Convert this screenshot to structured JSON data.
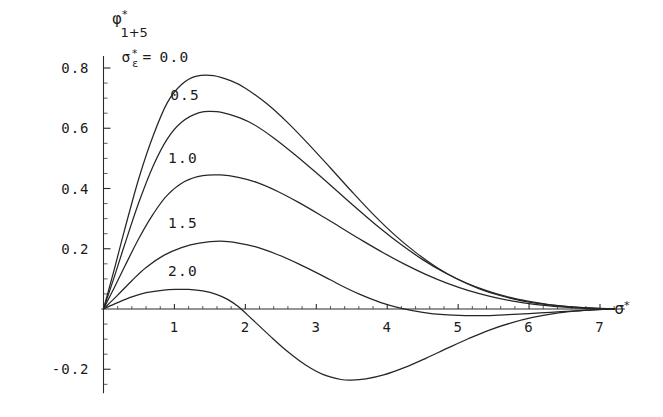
{
  "chart_data": {
    "type": "line",
    "title": "",
    "subtitle": "",
    "xlabel": "σ*",
    "ylabel": "φ*1+5",
    "ylabel_parts": {
      "base": "φ",
      "sup": "*",
      "sub": "1+5"
    },
    "xlabel_parts": {
      "base": "σ",
      "sup": "*"
    },
    "legend_title_parts": {
      "base": "σ",
      "sup": "*",
      "sub": "ε"
    },
    "legend_title": "σ*ε =",
    "legend_position": "inline-on-curves",
    "grid": false,
    "xlim": [
      0,
      7.35
    ],
    "ylim": [
      -0.28,
      0.84
    ],
    "x_ticks": [
      1,
      2,
      3,
      4,
      5,
      6,
      7
    ],
    "x_tick_labels": [
      "1",
      "2",
      "3",
      "4",
      "5",
      "6",
      "7"
    ],
    "x_minor_step": 0.2,
    "y_ticks": [
      0.8,
      0.6,
      0.4,
      0.2,
      -0.2
    ],
    "y_tick_labels": [
      "0.8",
      "0.6",
      "0.4",
      "0.2",
      "-0.2"
    ],
    "y_minor_step": 0.05,
    "series": [
      {
        "name": "0.0",
        "label": "0.0",
        "label_text": "σ*ε = 0.0",
        "peak_x": 1.55,
        "peak_y": 0.775,
        "x": [
          0,
          0.15,
          0.3,
          0.5,
          0.7,
          0.9,
          1.1,
          1.3,
          1.55,
          1.8,
          2.0,
          2.3,
          2.6,
          2.9,
          3.2,
          3.5,
          3.8,
          4.1,
          4.4,
          4.7,
          5.0,
          5.3,
          5.6,
          5.9,
          6.2,
          6.5,
          6.8,
          7.0,
          7.2
        ],
        "values": [
          0,
          0.13,
          0.265,
          0.435,
          0.575,
          0.685,
          0.745,
          0.772,
          0.775,
          0.757,
          0.733,
          0.682,
          0.618,
          0.545,
          0.468,
          0.39,
          0.315,
          0.247,
          0.188,
          0.138,
          0.098,
          0.067,
          0.044,
          0.027,
          0.016,
          0.009,
          0.004,
          0.002,
          0.001
        ]
      },
      {
        "name": "0.5",
        "label": "0.5",
        "peak_x": 1.6,
        "peak_y": 0.655,
        "x": [
          0,
          0.15,
          0.3,
          0.5,
          0.7,
          0.9,
          1.1,
          1.35,
          1.6,
          1.85,
          2.1,
          2.4,
          2.7,
          3.0,
          3.3,
          3.6,
          3.9,
          4.2,
          4.5,
          4.8,
          5.1,
          5.4,
          5.7,
          6.0,
          6.3,
          6.6,
          6.9,
          7.1,
          7.2
        ],
        "values": [
          0,
          0.105,
          0.215,
          0.355,
          0.475,
          0.565,
          0.62,
          0.652,
          0.655,
          0.64,
          0.615,
          0.568,
          0.512,
          0.452,
          0.39,
          0.328,
          0.268,
          0.213,
          0.164,
          0.122,
          0.088,
          0.061,
          0.04,
          0.025,
          0.014,
          0.007,
          0.003,
          0.001,
          0.001
        ]
      },
      {
        "name": "1.0",
        "label": "1.0",
        "peak_x": 1.65,
        "peak_y": 0.445,
        "x": [
          0,
          0.15,
          0.3,
          0.5,
          0.7,
          0.9,
          1.15,
          1.4,
          1.65,
          1.9,
          2.15,
          2.45,
          2.75,
          3.05,
          3.35,
          3.65,
          3.95,
          4.25,
          4.55,
          4.85,
          5.15,
          5.45,
          5.75,
          6.05,
          6.35,
          6.65,
          6.95,
          7.15,
          7.2
        ],
        "values": [
          0,
          0.07,
          0.142,
          0.235,
          0.315,
          0.378,
          0.424,
          0.443,
          0.445,
          0.437,
          0.421,
          0.391,
          0.354,
          0.313,
          0.27,
          0.227,
          0.186,
          0.148,
          0.114,
          0.085,
          0.061,
          0.042,
          0.027,
          0.016,
          0.009,
          0.004,
          0.001,
          0,
          0
        ]
      },
      {
        "name": "1.5",
        "label": "1.5",
        "peak_x": 1.65,
        "peak_y": 0.225,
        "zero_crossing": 3.35,
        "dip_min_y": -0.022,
        "x": [
          0,
          0.2,
          0.4,
          0.6,
          0.85,
          1.1,
          1.35,
          1.65,
          1.9,
          2.15,
          2.45,
          2.75,
          3.05,
          3.35,
          3.6,
          3.9,
          4.2,
          4.5,
          4.8,
          5.1,
          5.4,
          5.7,
          6.0,
          6.3,
          6.6,
          6.9,
          7.1,
          7.2
        ],
        "values": [
          0,
          0.046,
          0.094,
          0.138,
          0.178,
          0.204,
          0.219,
          0.225,
          0.219,
          0.206,
          0.181,
          0.15,
          0.115,
          0.078,
          0.05,
          0.022,
          0.002,
          -0.011,
          -0.019,
          -0.022,
          -0.022,
          -0.019,
          -0.015,
          -0.011,
          -0.007,
          -0.003,
          -0.001,
          0
        ]
      },
      {
        "name": "2.0",
        "label": "2.0",
        "peak_x": 1.2,
        "peak_y": 0.065,
        "zero_crossing": 1.9,
        "dip_min_x": 3.5,
        "dip_min_y": -0.235,
        "x": [
          0,
          0.2,
          0.4,
          0.6,
          0.85,
          1.05,
          1.2,
          1.4,
          1.6,
          1.75,
          1.9,
          2.1,
          2.35,
          2.6,
          2.85,
          3.1,
          3.35,
          3.5,
          3.7,
          3.95,
          4.25,
          4.55,
          4.85,
          5.15,
          5.45,
          5.75,
          6.05,
          6.35,
          6.65,
          6.95,
          7.15,
          7.2
        ],
        "values": [
          0,
          0.021,
          0.04,
          0.054,
          0.063,
          0.065,
          0.065,
          0.06,
          0.048,
          0.032,
          0.008,
          -0.035,
          -0.09,
          -0.142,
          -0.186,
          -0.218,
          -0.234,
          -0.236,
          -0.232,
          -0.219,
          -0.194,
          -0.163,
          -0.13,
          -0.098,
          -0.069,
          -0.046,
          -0.028,
          -0.015,
          -0.007,
          -0.002,
          0,
          0
        ]
      }
    ],
    "curve_label_positions": [
      {
        "name": "0.0",
        "x": 1.0,
        "y": 0.82
      },
      {
        "name": "0.5",
        "x": 1.15,
        "y": 0.695
      },
      {
        "name": "1.0",
        "x": 1.12,
        "y": 0.485
      },
      {
        "name": "1.5",
        "x": 1.12,
        "y": 0.268
      },
      {
        "name": "2.0",
        "x": 1.12,
        "y": 0.108
      }
    ],
    "colors": {
      "curve": "#262626",
      "axis": "#2b2b2b",
      "text": "#1a1a1a",
      "background": "#ffffff"
    }
  }
}
